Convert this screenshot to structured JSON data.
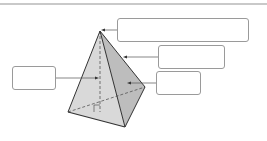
{
  "diagram": {
    "shape": "triangular-pyramid",
    "colors": {
      "left_face": "#d9d9d9",
      "right_face": "#bdbdbd",
      "edge": "#333333",
      "hidden_edge": "#555555",
      "box_border": "#9a9a9a",
      "rule": "#c9c9c9"
    },
    "labels": [
      {
        "id": "apex",
        "text": ""
      },
      {
        "id": "edge",
        "text": ""
      },
      {
        "id": "face",
        "text": ""
      },
      {
        "id": "height",
        "text": ""
      }
    ]
  }
}
